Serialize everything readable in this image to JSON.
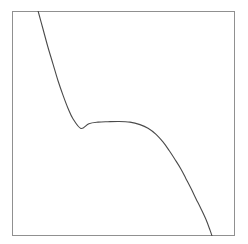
{
  "figure": {
    "title": "",
    "subtitle": "",
    "background_color": "#ffffff",
    "width": 248,
    "height": 244
  },
  "plot_frame": {
    "x": 12,
    "y": 11,
    "width": 223,
    "height": 225,
    "border_color": "#909090",
    "border_width": 1,
    "fill_color": "#ffffff"
  },
  "curve_style": {
    "color": "#4a4a4a",
    "width": 1.1
  },
  "chart_data": {
    "type": "line",
    "title": "",
    "subtitle": "",
    "xlabel": "",
    "ylabel": "",
    "xlim": [
      0,
      1
    ],
    "ylim": [
      0,
      1
    ],
    "grid": false,
    "legend": null,
    "xticks": [],
    "yticks": [],
    "xticklabels": [],
    "yticklabels": [],
    "annotations": [],
    "series": [
      {
        "name": "cubic-s-curve",
        "color": "#4a4a4a",
        "linewidth": 1.1,
        "linestyle": "solid",
        "marker": "none",
        "x": [
          0.117,
          0.139,
          0.161,
          0.184,
          0.206,
          0.229,
          0.251,
          0.274,
          0.309,
          0.345,
          0.386,
          0.43,
          0.48,
          0.529,
          0.574,
          0.61,
          0.646,
          0.677,
          0.704,
          0.731,
          0.758,
          0.78,
          0.803,
          0.825,
          0.848,
          0.87,
          0.888,
          0.897
        ],
        "y": [
          1.0,
          0.92,
          0.84,
          0.764,
          0.691,
          0.625,
          0.568,
          0.52,
          0.478,
          0.499,
          0.506,
          0.508,
          0.509,
          0.506,
          0.495,
          0.479,
          0.452,
          0.418,
          0.381,
          0.34,
          0.297,
          0.255,
          0.211,
          0.166,
          0.12,
          0.073,
          0.026,
          0.0
        ]
      }
    ],
    "path_d": "M 38 11 C 46 41, 55 70, 68 86 C 78 99, 86 111, 96 120 C 104 127, 116 128, 128 128 C 140 128, 150 128, 158 134 C 170 143, 180 160, 190 182 C 198 200, 206 220, 212 236"
  },
  "accessibility": {
    "figure_role": "plot",
    "curve_name": "cubic-s-curve"
  }
}
